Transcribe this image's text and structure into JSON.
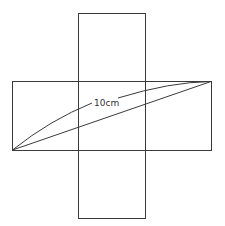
{
  "diagram": {
    "type": "cross-shaped net with diagonal measurement",
    "label": "10cm",
    "stroke_color": "#3a3a3a",
    "background": "#ffffff",
    "vertical_rect": {
      "x": 78,
      "y": 13,
      "width": 67,
      "height": 205
    },
    "horizontal_rect": {
      "x": 12,
      "y": 81,
      "width": 199,
      "height": 69
    },
    "diagonal": {
      "x1": 12,
      "y1": 150,
      "x2": 211,
      "y2": 81
    }
  }
}
